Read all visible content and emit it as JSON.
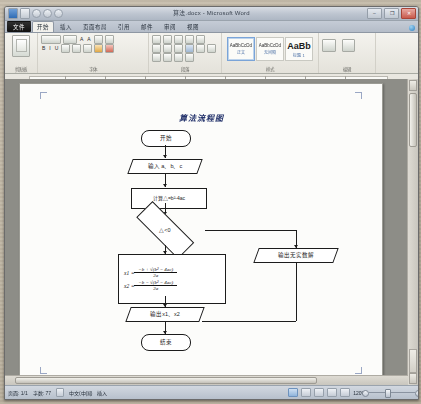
{
  "window": {
    "title": "算法.docx - Microsoft Word",
    "quick_access": [
      "word-logo",
      "save-icon",
      "undo-icon",
      "redo-icon",
      "customize-icon"
    ],
    "controls": {
      "minimize": "–",
      "maximize": "❐",
      "close": "✕"
    }
  },
  "ribbon": {
    "file_tab": "文件",
    "tabs": [
      "开始",
      "插入",
      "页面布局",
      "引用",
      "邮件",
      "审阅",
      "视图"
    ],
    "active_tab": "开始",
    "help_icons": [
      "help-icon",
      "minimize-ribbon-icon"
    ],
    "groups": [
      {
        "name": "剪贴板",
        "label": "剪贴板"
      },
      {
        "name": "字体",
        "label": "字体"
      },
      {
        "name": "段落",
        "label": "段落"
      },
      {
        "name": "样式",
        "label": "样式"
      },
      {
        "name": "编辑",
        "label": "编辑"
      }
    ],
    "font_controls": {
      "font_name": "宋体(中文正文)",
      "font_size": "五号",
      "grow_font": "A",
      "shrink_font": "A",
      "bold": "B",
      "italic": "I",
      "underline": "U"
    },
    "styles": [
      {
        "preview": "AaBbCcDd",
        "name": "正文",
        "selected": true
      },
      {
        "preview": "AaBbCcDd",
        "name": "无间隔",
        "selected": false
      },
      {
        "preview": "AaBb",
        "name": "标题 1",
        "selected": false
      }
    ],
    "editing": {
      "find": "查找替换",
      "select": "选择"
    }
  },
  "ruler": {
    "unit_marks": 9
  },
  "document": {
    "title": "算法流程图",
    "flowchart": {
      "nodes": [
        {
          "id": "start",
          "shape": "terminator",
          "label": "开始"
        },
        {
          "id": "input",
          "shape": "parallelogram",
          "label": "输入 a、b、c"
        },
        {
          "id": "calc",
          "shape": "process",
          "label": "计算△=b²-4ac"
        },
        {
          "id": "decide",
          "shape": "decision",
          "label": "△<0"
        },
        {
          "id": "noreal",
          "shape": "parallelogram",
          "label": "输出无实数解"
        },
        {
          "id": "output",
          "shape": "parallelogram",
          "label": "输出x1、x2"
        },
        {
          "id": "end",
          "shape": "terminator",
          "label": "结束"
        }
      ],
      "formula_box": {
        "x1": {
          "var": "x1",
          "equals": "=",
          "numerator": "−b + √(b² − 4ac)",
          "denominator": "2a"
        },
        "x2": {
          "var": "x2",
          "equals": "=",
          "numerator": "−b − √(b² − 4ac)",
          "denominator": "2a"
        }
      }
    }
  },
  "status_bar": {
    "page": "页面: 1/1",
    "words": "字数: 77",
    "proofing": "校对-icon",
    "language": "中文(中国)",
    "insert_mode": "插入",
    "view_buttons": [
      "print-layout-view",
      "full-screen-view",
      "web-layout-view",
      "outline-view",
      "draft-view"
    ],
    "zoom_level": "120%"
  }
}
